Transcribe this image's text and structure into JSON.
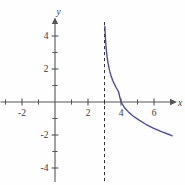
{
  "figure": {
    "title": "",
    "background_color": "#fefefe",
    "axis_color": "#555555",
    "curve_color": "#4a4a9c",
    "asymptote_color": "#333333",
    "label_color": "#3a3a3a"
  },
  "axes": {
    "x_label": "x",
    "y_label": "y",
    "x_tick_labels": [
      "-2",
      "2",
      "4",
      "6"
    ],
    "y_tick_labels": [
      "4",
      "2",
      "-2",
      "-4"
    ],
    "x_tick_values": [
      -2,
      2,
      4,
      6
    ],
    "y_tick_values": [
      4,
      2,
      -2,
      -4
    ],
    "x_minor_ticks": [
      -3,
      -1,
      1,
      3,
      5,
      7
    ],
    "y_minor_ticks": [
      3,
      1,
      -1,
      -3
    ]
  },
  "chart_data": {
    "type": "line",
    "title": "",
    "xlabel": "x",
    "ylabel": "y",
    "xlim": [
      -3.3,
      7.8
    ],
    "ylim": [
      -5.0,
      5.1
    ],
    "grid": false,
    "legend": null,
    "annotations": [
      {
        "kind": "vertical-asymptote",
        "x": 3,
        "style": "dashed",
        "label": ""
      },
      {
        "kind": "x-intercept",
        "x": 4,
        "y": 0,
        "label": ""
      }
    ],
    "series": [
      {
        "name": "y = -log(x - 3)",
        "color": "#4a4a9c",
        "style": "solid",
        "x": [
          3.02,
          3.04,
          3.06,
          3.09,
          3.12,
          3.16,
          3.2,
          3.26,
          3.33,
          3.4,
          3.5,
          3.6,
          3.72,
          3.85,
          4.0,
          4.2,
          4.45,
          4.75,
          5.1,
          5.5,
          5.95,
          6.45,
          7.0,
          7.1
        ],
        "y": [
          4.6,
          4.2,
          3.8,
          3.4,
          3.05,
          2.72,
          2.45,
          2.13,
          1.82,
          1.58,
          1.3,
          1.08,
          0.85,
          0.62,
          0.0,
          -0.33,
          -0.6,
          -0.86,
          -1.1,
          -1.35,
          -1.58,
          -1.8,
          -2.0,
          -2.05
        ]
      }
    ]
  }
}
